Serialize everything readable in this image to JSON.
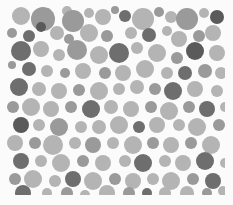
{
  "image": {
    "description": "Grayscale circle-packing dot pattern",
    "width": 233,
    "height": 205,
    "pattern_box": {
      "x": 7,
      "y": 3,
      "w": 218,
      "h": 192
    },
    "palette": {
      "background": "#fbfbfb",
      "light": "#b4b4b4",
      "mid": "#9a9a9a",
      "dark": "#6e6e6e",
      "darker": "#5a5a5a"
    },
    "circles": [
      [
        14,
        13,
        9,
        "light"
      ],
      [
        36,
        16,
        12,
        "mid"
      ],
      [
        40,
        9,
        4,
        "mid"
      ],
      [
        60,
        8,
        5,
        "light"
      ],
      [
        66,
        18,
        11,
        "mid"
      ],
      [
        82,
        10,
        5,
        "light"
      ],
      [
        96,
        14,
        8,
        "light"
      ],
      [
        108,
        7,
        4,
        "mid"
      ],
      [
        118,
        13,
        6,
        "dark"
      ],
      [
        136,
        16,
        11,
        "light"
      ],
      [
        152,
        9,
        5,
        "mid"
      ],
      [
        164,
        14,
        6,
        "light"
      ],
      [
        180,
        16,
        11,
        "mid"
      ],
      [
        197,
        10,
        5,
        "light"
      ],
      [
        210,
        14,
        7,
        "darker"
      ],
      [
        5,
        30,
        5,
        "mid"
      ],
      [
        22,
        33,
        6,
        "dark"
      ],
      [
        34,
        24,
        5,
        "darker"
      ],
      [
        50,
        30,
        7,
        "light"
      ],
      [
        62,
        36,
        5,
        "mid"
      ],
      [
        82,
        30,
        9,
        "light"
      ],
      [
        100,
        33,
        6,
        "mid"
      ],
      [
        124,
        30,
        6,
        "light"
      ],
      [
        142,
        32,
        7,
        "dark"
      ],
      [
        160,
        28,
        5,
        "light"
      ],
      [
        172,
        36,
        8,
        "light"
      ],
      [
        192,
        33,
        6,
        "mid"
      ],
      [
        206,
        30,
        8,
        "light"
      ],
      [
        14,
        48,
        10,
        "dark"
      ],
      [
        34,
        46,
        8,
        "light"
      ],
      [
        52,
        52,
        6,
        "light"
      ],
      [
        70,
        47,
        10,
        "mid"
      ],
      [
        92,
        52,
        9,
        "light"
      ],
      [
        112,
        50,
        10,
        "dark"
      ],
      [
        130,
        45,
        6,
        "light"
      ],
      [
        150,
        50,
        9,
        "light"
      ],
      [
        170,
        55,
        6,
        "mid"
      ],
      [
        188,
        48,
        9,
        "darker"
      ],
      [
        210,
        50,
        8,
        "light"
      ],
      [
        5,
        62,
        4,
        "mid"
      ],
      [
        22,
        66,
        7,
        "dark"
      ],
      [
        40,
        68,
        6,
        "light"
      ],
      [
        58,
        70,
        5,
        "mid"
      ],
      [
        76,
        68,
        8,
        "light"
      ],
      [
        98,
        70,
        6,
        "mid"
      ],
      [
        116,
        70,
        8,
        "light"
      ],
      [
        138,
        66,
        9,
        "light"
      ],
      [
        160,
        70,
        6,
        "light"
      ],
      [
        178,
        70,
        7,
        "dark"
      ],
      [
        198,
        68,
        7,
        "mid"
      ],
      [
        214,
        70,
        6,
        "light"
      ],
      [
        12,
        84,
        9,
        "dark"
      ],
      [
        32,
        86,
        7,
        "light"
      ],
      [
        52,
        88,
        8,
        "light"
      ],
      [
        72,
        87,
        6,
        "mid"
      ],
      [
        92,
        88,
        9,
        "light"
      ],
      [
        112,
        86,
        6,
        "light"
      ],
      [
        130,
        84,
        7,
        "light"
      ],
      [
        148,
        86,
        6,
        "mid"
      ],
      [
        166,
        88,
        9,
        "dark"
      ],
      [
        188,
        86,
        8,
        "light"
      ],
      [
        210,
        88,
        6,
        "light"
      ],
      [
        6,
        104,
        6,
        "mid"
      ],
      [
        24,
        104,
        9,
        "light"
      ],
      [
        44,
        106,
        8,
        "light"
      ],
      [
        64,
        104,
        6,
        "mid"
      ],
      [
        84,
        106,
        9,
        "dark"
      ],
      [
        104,
        104,
        7,
        "light"
      ],
      [
        124,
        106,
        8,
        "light"
      ],
      [
        144,
        104,
        6,
        "mid"
      ],
      [
        162,
        108,
        9,
        "light"
      ],
      [
        182,
        104,
        6,
        "mid"
      ],
      [
        200,
        106,
        8,
        "dark"
      ],
      [
        218,
        104,
        5,
        "light"
      ],
      [
        14,
        122,
        8,
        "darker"
      ],
      [
        32,
        122,
        6,
        "light"
      ],
      [
        52,
        124,
        9,
        "mid"
      ],
      [
        74,
        124,
        6,
        "light"
      ],
      [
        92,
        124,
        7,
        "light"
      ],
      [
        112,
        122,
        9,
        "light"
      ],
      [
        132,
        124,
        6,
        "dark"
      ],
      [
        150,
        122,
        8,
        "light"
      ],
      [
        172,
        122,
        6,
        "light"
      ],
      [
        190,
        124,
        9,
        "light"
      ],
      [
        212,
        122,
        6,
        "mid"
      ],
      [
        8,
        140,
        8,
        "light"
      ],
      [
        28,
        140,
        6,
        "mid"
      ],
      [
        46,
        142,
        10,
        "light"
      ],
      [
        68,
        140,
        6,
        "light"
      ],
      [
        86,
        142,
        8,
        "mid"
      ],
      [
        106,
        140,
        6,
        "light"
      ],
      [
        126,
        142,
        9,
        "light"
      ],
      [
        146,
        140,
        6,
        "mid"
      ],
      [
        164,
        142,
        8,
        "light"
      ],
      [
        184,
        140,
        6,
        "mid"
      ],
      [
        204,
        142,
        9,
        "light"
      ],
      [
        14,
        158,
        8,
        "dark"
      ],
      [
        34,
        158,
        6,
        "light"
      ],
      [
        54,
        160,
        9,
        "light"
      ],
      [
        76,
        158,
        6,
        "mid"
      ],
      [
        96,
        160,
        8,
        "light"
      ],
      [
        118,
        158,
        6,
        "light"
      ],
      [
        136,
        160,
        9,
        "dark"
      ],
      [
        158,
        158,
        6,
        "light"
      ],
      [
        176,
        160,
        8,
        "light"
      ],
      [
        198,
        158,
        9,
        "dark"
      ],
      [
        218,
        160,
        5,
        "light"
      ],
      [
        8,
        176,
        6,
        "mid"
      ],
      [
        26,
        176,
        9,
        "light"
      ],
      [
        48,
        178,
        6,
        "light"
      ],
      [
        66,
        176,
        8,
        "dark"
      ],
      [
        86,
        178,
        9,
        "light"
      ],
      [
        108,
        176,
        6,
        "mid"
      ],
      [
        126,
        178,
        8,
        "light"
      ],
      [
        146,
        176,
        6,
        "light"
      ],
      [
        164,
        178,
        9,
        "light"
      ],
      [
        186,
        176,
        6,
        "mid"
      ],
      [
        206,
        178,
        8,
        "dark"
      ],
      [
        16,
        190,
        8,
        "dark"
      ],
      [
        40,
        190,
        5,
        "light"
      ],
      [
        60,
        190,
        6,
        "mid"
      ],
      [
        78,
        192,
        5,
        "light"
      ],
      [
        100,
        190,
        8,
        "light"
      ],
      [
        122,
        190,
        6,
        "mid"
      ],
      [
        140,
        190,
        5,
        "dark"
      ],
      [
        158,
        190,
        6,
        "light"
      ],
      [
        180,
        190,
        7,
        "light"
      ],
      [
        200,
        190,
        5,
        "mid"
      ],
      [
        216,
        188,
        5,
        "light"
      ]
    ]
  }
}
